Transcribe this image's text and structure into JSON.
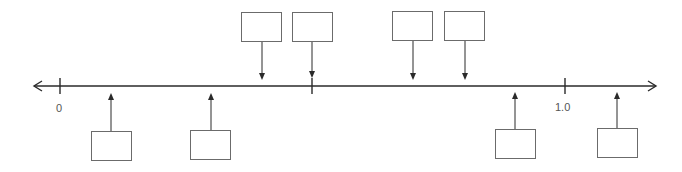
{
  "number_line": {
    "y": 86,
    "x_start": 34,
    "x_end": 656,
    "line_color": "#2a2a2a",
    "ticks": [
      {
        "x": 60,
        "label": "0"
      },
      {
        "x": 312,
        "label": ""
      },
      {
        "x": 565,
        "label": "1.0"
      }
    ]
  },
  "boxes_above": [
    {
      "x": 241,
      "y": 12,
      "arrow_x": 262,
      "arrow_tip_y": 80
    },
    {
      "x": 292,
      "y": 12,
      "arrow_x": 312,
      "arrow_tip_y": 78
    },
    {
      "x": 392,
      "y": 11,
      "arrow_x": 413,
      "arrow_tip_y": 80
    },
    {
      "x": 444,
      "y": 11,
      "arrow_x": 465,
      "arrow_tip_y": 80
    }
  ],
  "boxes_below": [
    {
      "x": 91,
      "y": 131,
      "arrow_x": 111,
      "arrow_tip_y": 93
    },
    {
      "x": 190,
      "y": 130,
      "arrow_x": 211,
      "arrow_tip_y": 93
    },
    {
      "x": 495,
      "y": 129,
      "arrow_x": 515,
      "arrow_tip_y": 92
    },
    {
      "x": 597,
      "y": 128,
      "arrow_x": 617,
      "arrow_tip_y": 92
    }
  ],
  "labels": {
    "zero": "0",
    "one": "1.0"
  }
}
